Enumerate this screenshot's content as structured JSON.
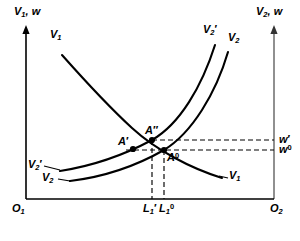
{
  "figure": {
    "type": "economics-diagram",
    "background": "#ffffff",
    "ink": "#000000",
    "width": 300,
    "height": 241
  },
  "axes": {
    "left": {
      "label": "V1, w",
      "label_text": "V",
      "label_sub": "1",
      "label_rest": ", w",
      "origin_label": "O",
      "origin_sub": "1",
      "x": 26,
      "top": 28,
      "bottom": 199,
      "arrow": true,
      "color": "#000000"
    },
    "right": {
      "label": "V2, w",
      "label_text": "V",
      "label_sub": "2",
      "label_rest": ", w",
      "origin_label": "O",
      "origin_sub": "2",
      "x": 274,
      "top": 28,
      "bottom": 199,
      "arrow": true,
      "color": "#555555"
    },
    "bottom": {
      "y": 199,
      "from_x": 26,
      "to_x": 274,
      "color": "#000000"
    }
  },
  "curves": [
    {
      "name": "V1",
      "label": "V",
      "label_sub": "1",
      "label_prime": "",
      "shape": "downward-sloping",
      "label_positions": [
        "upper-left",
        "lower-right"
      ],
      "path": "M 62,55 C 86,82 108,106 132,128 C 156,150 190,168 222,178"
    },
    {
      "name": "V2prime",
      "label": "V",
      "label_sub": "2",
      "label_prime": "′",
      "shape": "upward-sloping",
      "label_positions": [
        "lower-left",
        "upper-right"
      ],
      "path": "M 60,171 C 92,166 124,155 152,140 C 180,124 202,86 215,45"
    },
    {
      "name": "V2",
      "label": "V",
      "label_sub": "2",
      "label_prime": "",
      "shape": "upward-sloping",
      "label_positions": [
        "lower-left",
        "upper-right"
      ],
      "path": "M 70,181 C 103,177 136,166 164,150 C 192,133 216,93 228,52"
    }
  ],
  "points": [
    {
      "id": "A2",
      "label": "A",
      "prime": "″",
      "x": 152,
      "y": 140,
      "filled": true
    },
    {
      "id": "A1",
      "label": "A",
      "prime": "′",
      "x": 133,
      "y": 149,
      "filled": true
    },
    {
      "id": "A0",
      "label": "A",
      "sup": "0",
      "x": 164,
      "y": 150,
      "filled": true
    }
  ],
  "guides": {
    "horizontal": [
      {
        "id": "w-prime",
        "y": 140,
        "from_x": 152,
        "to_x": 274,
        "label": "w",
        "prime": "′",
        "sup": ""
      },
      {
        "id": "w-zero",
        "y": 150,
        "from_x": 126,
        "to_x": 274,
        "label": "w",
        "prime": "",
        "sup": "0"
      }
    ],
    "vertical": [
      {
        "id": "L1-prime",
        "x": 152,
        "from_y": 140,
        "to_y": 199,
        "label": "L",
        "sub": "1",
        "prime": "′",
        "sup": ""
      },
      {
        "id": "L1-zero",
        "x": 164,
        "from_y": 150,
        "to_y": 199,
        "label": "L",
        "sub": "1",
        "prime": "",
        "sup": "0"
      }
    ],
    "dash": "5,3",
    "color": "#000000"
  },
  "wage_labels": [
    {
      "id": "w-prime-label",
      "text": "w",
      "prime": "′",
      "sup": "",
      "x": 279,
      "y": 134
    },
    {
      "id": "w-zero-label",
      "text": "w",
      "prime": "",
      "sup": "0",
      "x": 279,
      "y": 144
    }
  ],
  "axis_tick_labels": [
    {
      "id": "L1-prime-label",
      "text": "L",
      "sub": "1",
      "prime": "′",
      "sup": "",
      "x": 143,
      "y": 203
    },
    {
      "id": "L1-zero-label",
      "text": "L",
      "sub": "1",
      "prime": "",
      "sup": "0",
      "x": 158,
      "y": 203
    }
  ],
  "curve_labels": [
    {
      "id": "V1-top",
      "text": "V",
      "sub": "1",
      "prime": "",
      "x": 50,
      "y": 33
    },
    {
      "id": "V1-bottom",
      "text": "V",
      "sub": "1",
      "prime": "",
      "x": 222,
      "y": 175
    },
    {
      "id": "V2prime-top",
      "text": "V",
      "sub": "2",
      "prime": "′",
      "x": 205,
      "y": 28
    },
    {
      "id": "V2-top",
      "text": "V",
      "sub": "2",
      "prime": "",
      "x": 228,
      "y": 36
    },
    {
      "id": "V2prime-left",
      "text": "V",
      "sub": "2",
      "prime": "′",
      "x": 28,
      "y": 163
    },
    {
      "id": "V2-left",
      "text": "V",
      "sub": "2",
      "prime": "",
      "x": 42,
      "y": 176
    }
  ],
  "origin_labels": [
    {
      "id": "O1",
      "text": "O",
      "sub": "1",
      "x": 14,
      "y": 205
    },
    {
      "id": "O2",
      "text": "O",
      "sub": "2",
      "x": 272,
      "y": 205
    }
  ],
  "axis_titles": [
    {
      "id": "left-axis-title",
      "text": "V",
      "sub": "1",
      "rest": ", w",
      "x": 14,
      "y": 8
    },
    {
      "id": "right-axis-title",
      "text": "V",
      "sub": "2",
      "rest": ", w",
      "x": 258,
      "y": 8
    }
  ]
}
